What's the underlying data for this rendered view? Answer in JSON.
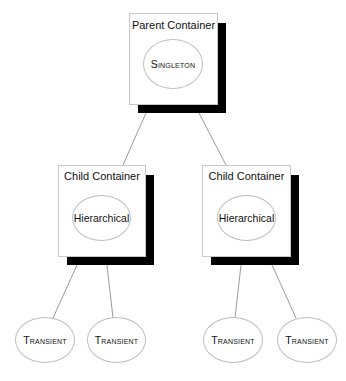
{
  "diagram": {
    "parent": {
      "title": "Parent Container",
      "scope": "Singleton"
    },
    "children": [
      {
        "title": "Child Container",
        "scope": "Hierarchical",
        "leaves": [
          "Transient",
          "Transient"
        ]
      },
      {
        "title": "Child Container",
        "scope": "Hierarchical",
        "leaves": [
          "Transient",
          "Transient"
        ]
      }
    ]
  },
  "colors": {
    "shadow": "#000000",
    "border": "#c8c8c8",
    "connector": "#9a9a9a"
  }
}
